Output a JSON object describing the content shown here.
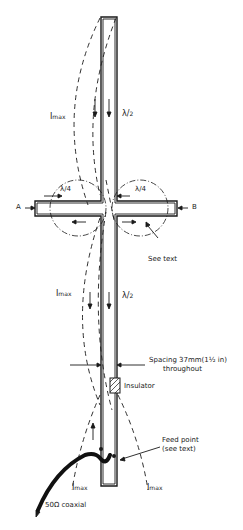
{
  "diagram": {
    "title": "",
    "colors": {
      "ink": "#1a1a1a",
      "background": "#ffffff"
    },
    "labels": {
      "imax_top": {
        "main": "I",
        "sub": "max"
      },
      "lambda_half_top": {
        "main": "λ",
        "sub": "2"
      },
      "lambda_quarter_left": {
        "main": "λ",
        "sub": "4"
      },
      "lambda_quarter_right": {
        "main": "λ",
        "sub": "4"
      },
      "point_a": "A",
      "point_b": "B",
      "see_text": "See text",
      "imax_middle": {
        "main": "I",
        "sub": "max"
      },
      "lambda_half_bottom": {
        "main": "λ",
        "sub": "2"
      },
      "spacing_line1": "Spacing 37mm(1½ in)",
      "spacing_line2": "throughout",
      "insulator": "Insulator",
      "feed_point_line1": "Feed point",
      "feed_point_line2": "(see text)",
      "imax_bottom_left": {
        "main": "I",
        "sub": "max"
      },
      "imax_bottom_right": {
        "main": "I",
        "sub": "max"
      },
      "coax": "50Ω coaxial"
    }
  }
}
